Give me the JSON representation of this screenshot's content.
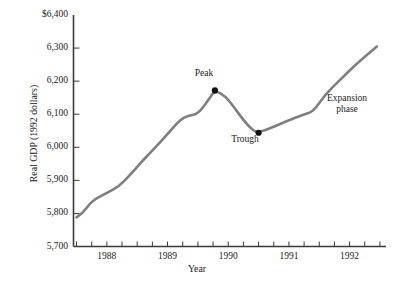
{
  "chart_data": {
    "type": "line",
    "title": "",
    "subtitle": "",
    "xlabel": "Year",
    "ylabel": "Real GDP (1992 dollars)",
    "xlim": [
      1987.45,
      1992.6
    ],
    "ylim": [
      5700,
      6400
    ],
    "grid": false,
    "legend": "none",
    "line_color": "#7f7f7f",
    "marker_color": "#101010",
    "axis_color": "#3a3a3a",
    "y_ticks": [
      5700,
      5800,
      5900,
      6000,
      6100,
      6200,
      6300,
      6400
    ],
    "y_tick_labels": [
      "5,700",
      "5,800",
      "5,900",
      "6,000",
      "6,100",
      "6,200",
      "6,300",
      "$6,400"
    ],
    "x_ticks": [
      1987.5,
      1987.75,
      1988.0,
      1988.25,
      1988.5,
      1988.75,
      1989.0,
      1989.25,
      1989.5,
      1989.75,
      1990.0,
      1990.25,
      1990.5,
      1990.75,
      1991.0,
      1991.25,
      1991.5,
      1991.75,
      1992.0,
      1992.25,
      1992.5
    ],
    "x_tick_labels": [
      "1988",
      "1989",
      "1990",
      "1991",
      "1992"
    ],
    "x_tick_label_positions": [
      1988.0,
      1989.0,
      1990.0,
      1991.0,
      1992.0
    ],
    "x": [
      1987.5,
      1987.6,
      1987.75,
      1988.0,
      1988.2,
      1988.4,
      1988.6,
      1988.75,
      1989.0,
      1989.2,
      1989.35,
      1989.5,
      1989.7,
      1989.78,
      1989.95,
      1990.1,
      1990.25,
      1990.4,
      1990.5,
      1990.75,
      1991.0,
      1991.25,
      1991.4,
      1991.6,
      1991.85,
      1992.1,
      1992.45
    ],
    "y": [
      5788,
      5800,
      5838,
      5862,
      5882,
      5920,
      5962,
      5990,
      6040,
      6082,
      6097,
      6100,
      6150,
      6172,
      6155,
      6120,
      6082,
      6052,
      6044,
      6062,
      6082,
      6100,
      6108,
      6160,
      6205,
      6250,
      6305
    ],
    "series": [
      {
        "name": "Real GDP (1992 dollars)",
        "x": [
          1987.5,
          1987.6,
          1987.75,
          1988.0,
          1988.2,
          1988.4,
          1988.6,
          1988.75,
          1989.0,
          1989.2,
          1989.35,
          1989.5,
          1989.7,
          1989.78,
          1989.95,
          1990.1,
          1990.25,
          1990.4,
          1990.5,
          1990.75,
          1991.0,
          1991.25,
          1991.4,
          1991.6,
          1991.85,
          1992.1,
          1992.45
        ],
        "values": [
          5788,
          5800,
          5838,
          5862,
          5882,
          5920,
          5962,
          5990,
          6040,
          6082,
          6097,
          6100,
          6150,
          6172,
          6155,
          6120,
          6082,
          6052,
          6044,
          6062,
          6082,
          6100,
          6108,
          6160,
          6205,
          6250,
          6305
        ]
      }
    ],
    "markers": [
      {
        "label": "Peak",
        "x": 1989.78,
        "y": 6172
      },
      {
        "label": "Trough",
        "x": 1990.5,
        "y": 6044
      }
    ],
    "annotations": [
      {
        "name": "peak",
        "text": "Peak"
      },
      {
        "name": "trough",
        "text": "Trough"
      },
      {
        "name": "expansion",
        "line1": "Expansion",
        "line2": "phase"
      }
    ]
  },
  "labels": {
    "y_axis_title": "Real GDP (1992 dollars)",
    "x_axis_title": "Year",
    "peak": "Peak",
    "trough": "Trough",
    "expansion_line1": "Expansion",
    "expansion_line2": "phase"
  }
}
